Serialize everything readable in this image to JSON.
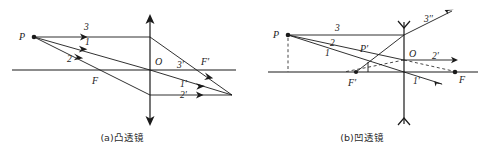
{
  "figure": {
    "title": "",
    "panels": [
      {
        "id": "a",
        "caption": "(a)凸透镜",
        "lens_type": "convex",
        "labels": {
          "object_point": "P",
          "optical_center": "O",
          "focus_left": "F",
          "focus_right": "F′",
          "ray1": "1",
          "ray2": "2",
          "ray3": "3",
          "ray1_out": "1′",
          "ray2_out": "2′",
          "ray3_out": "3′"
        }
      },
      {
        "id": "b",
        "caption": "(b)凹透镜",
        "lens_type": "concave",
        "labels": {
          "object_point": "P",
          "image_point": "P′",
          "optical_center": "O",
          "focus_left": "F′",
          "focus_right": "F",
          "ray1": "1",
          "ray2": "2",
          "ray3": "3",
          "ray1_out": "1′",
          "ray2_out": "2′",
          "ray3_out": "3′′"
        }
      }
    ]
  },
  "colors": {
    "ink": "#1a1a1a",
    "background": "#ffffff"
  }
}
